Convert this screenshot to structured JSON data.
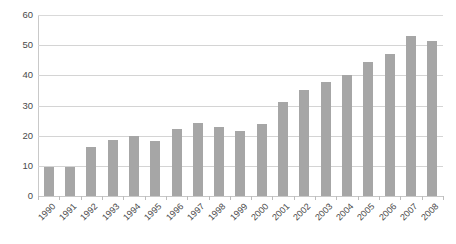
{
  "chart_data": {
    "type": "bar",
    "title": "",
    "subtitle": "",
    "xlabel": "",
    "ylabel": "",
    "categories": [
      "1990",
      "1991",
      "1992",
      "1993",
      "1994",
      "1995",
      "1996",
      "1997",
      "1998",
      "1999",
      "2000",
      "2001",
      "2002",
      "2003",
      "2004",
      "2005",
      "2006",
      "2007",
      "2008"
    ],
    "values": [
      9.5,
      9.7,
      16.2,
      18.7,
      19.9,
      18.4,
      22.1,
      24.3,
      23.0,
      21.7,
      23.9,
      31.0,
      35.0,
      37.7,
      40.1,
      44.4,
      47.0,
      53.2,
      51.5
    ],
    "series": [
      {
        "name": "",
        "values": [
          9.5,
          9.7,
          16.2,
          18.7,
          19.9,
          18.4,
          22.1,
          24.3,
          23.0,
          21.7,
          23.9,
          31.0,
          35.0,
          37.7,
          40.1,
          44.4,
          47.0,
          53.2,
          51.5
        ]
      }
    ],
    "ylim": [
      0,
      60
    ],
    "yticks": [
      0,
      10,
      20,
      30,
      40,
      50,
      60
    ],
    "ytick_labels": [
      "0",
      "10",
      "20",
      "30",
      "40",
      "50",
      "60"
    ],
    "grid": true,
    "grid_axis": "y",
    "legend": false,
    "legend_position": "none",
    "annotations": [],
    "bar_color": "#a6a6a6",
    "gridline_color": "#d4d4d4",
    "axis_color": "#c9c9c9",
    "background_color": "#ffffff",
    "tick_label_color": "#4a4a4a",
    "xtick_label_rotation": "-45"
  }
}
